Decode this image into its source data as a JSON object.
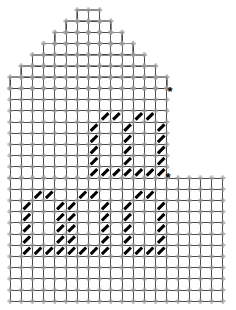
{
  "chart_data": {
    "type": "heatmap",
    "title": "",
    "subtitle": "",
    "xlabel": "",
    "ylabel": "",
    "grid": true,
    "legend": null,
    "cell_px": 11.2,
    "origin": {
      "x": 10,
      "y": 10
    },
    "colors": {
      "grid_line": "#3a3a3a",
      "grid_node": "#9a9a9a",
      "mark": "#000000",
      "background": "#ffffff",
      "star": "#000000",
      "roof_outline": "#8c8c8c"
    },
    "axis_ranges": {
      "cols": [
        0,
        19
      ],
      "rows": [
        0,
        25
      ]
    },
    "sections": [
      {
        "name": "roof",
        "rows": [
          0,
          6
        ],
        "shape": "stepped-triangle",
        "peak_col": 7
      },
      {
        "name": "upper-body",
        "cols": [
          0,
          13
        ],
        "rows": [
          6,
          14
        ]
      },
      {
        "name": "lower-body",
        "cols": [
          0,
          18
        ],
        "rows": [
          14,
          25
        ]
      }
    ],
    "roof_steps": [
      {
        "row": 0,
        "col_start": 6,
        "col_end": 8
      },
      {
        "row": 1,
        "col_start": 5,
        "col_end": 9
      },
      {
        "row": 2,
        "col_start": 4,
        "col_end": 10
      },
      {
        "row": 3,
        "col_start": 3,
        "col_end": 11
      },
      {
        "row": 4,
        "col_start": 2,
        "col_end": 12
      },
      {
        "row": 5,
        "col_start": 1,
        "col_end": 13
      },
      {
        "row": 6,
        "col_start": 0,
        "col_end": 14
      }
    ],
    "marks_upper": [
      [
        2,
        8
      ],
      [
        2,
        9
      ],
      [
        2,
        11
      ],
      [
        2,
        12
      ],
      [
        3,
        7
      ],
      [
        3,
        10
      ],
      [
        3,
        13
      ],
      [
        4,
        7
      ],
      [
        4,
        10
      ],
      [
        4,
        13
      ],
      [
        5,
        7
      ],
      [
        5,
        10
      ],
      [
        5,
        13
      ],
      [
        6,
        7
      ],
      [
        6,
        10
      ],
      [
        6,
        13
      ],
      [
        7,
        7
      ],
      [
        7,
        8
      ],
      [
        7,
        9
      ],
      [
        7,
        10
      ],
      [
        7,
        11
      ],
      [
        7,
        12
      ],
      [
        7,
        13
      ]
    ],
    "marks_lower": [
      [
        1,
        2
      ],
      [
        1,
        3
      ],
      [
        1,
        6
      ],
      [
        1,
        7
      ],
      [
        1,
        11
      ],
      [
        1,
        12
      ],
      [
        2,
        1
      ],
      [
        2,
        4
      ],
      [
        2,
        5
      ],
      [
        2,
        8
      ],
      [
        2,
        10
      ],
      [
        2,
        13
      ],
      [
        3,
        1
      ],
      [
        3,
        4
      ],
      [
        3,
        5
      ],
      [
        3,
        8
      ],
      [
        3,
        10
      ],
      [
        3,
        13
      ],
      [
        4,
        1
      ],
      [
        4,
        4
      ],
      [
        4,
        5
      ],
      [
        4,
        8
      ],
      [
        4,
        10
      ],
      [
        4,
        13
      ],
      [
        5,
        1
      ],
      [
        5,
        4
      ],
      [
        5,
        5
      ],
      [
        5,
        8
      ],
      [
        5,
        10
      ],
      [
        5,
        13
      ],
      [
        6,
        1
      ],
      [
        6,
        2
      ],
      [
        6,
        3
      ],
      [
        6,
        4
      ],
      [
        6,
        5
      ],
      [
        6,
        6
      ],
      [
        6,
        7
      ],
      [
        6,
        8
      ],
      [
        6,
        10
      ],
      [
        6,
        11
      ],
      [
        6,
        12
      ],
      [
        6,
        13
      ]
    ],
    "markers": [
      {
        "name": "star-upper",
        "symbol": "*",
        "x": 170,
        "y": 93
      },
      {
        "name": "star-lower",
        "symbol": "*",
        "x": 168,
        "y": 179
      }
    ]
  }
}
